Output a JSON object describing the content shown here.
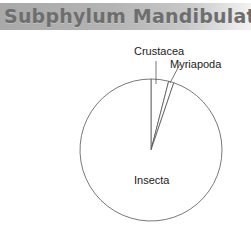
{
  "header": {
    "title": "Subphylum Mandibulata",
    "footnote": "13"
  },
  "chart_data": {
    "type": "pie",
    "title": "Subphylum Mandibulata",
    "categories": [
      "Crustacea",
      "Myriapoda",
      "Insecta"
    ],
    "values": [
      4.0,
      1.2,
      94.8
    ],
    "unit": "approximate % of described species (estimated from slice angles)",
    "start_angle_deg": 0,
    "direction": "clockwise",
    "legend": "none (direct labels)",
    "colors": {
      "fill": "#ffffff",
      "stroke": "#555555"
    }
  },
  "labels": {
    "crustacea": "Crustacea",
    "myriapoda": "Myriapoda",
    "insecta": "Insecta"
  }
}
